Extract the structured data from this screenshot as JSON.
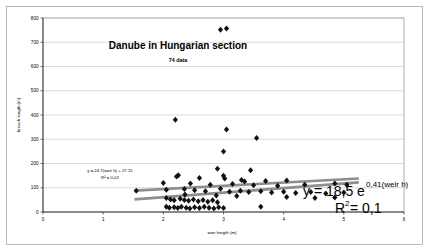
{
  "chart_data": {
    "type": "scatter",
    "title": "Danube in Hungarian section",
    "subtitle": "74 data",
    "xlabel": "weir heigth (m)",
    "ylabel": "breach length (m)",
    "xlim": [
      0,
      6
    ],
    "ylim": [
      0,
      800
    ],
    "xticks": [
      "0",
      "1",
      "2",
      "3",
      "4",
      "5",
      "6"
    ],
    "yticks": [
      "0",
      "100",
      "200",
      "300",
      "400",
      "500",
      "600",
      "700",
      "800"
    ],
    "grid": true,
    "legend": "none",
    "marker_symbol": "diamond",
    "marker_color": "#111111",
    "trendline_color": "#8e8e8e",
    "annotations": [
      {
        "name": "linear-fit-label",
        "line1": "y = 24.7(weir h) + 27.15",
        "line2": "R² = 0,02"
      },
      {
        "name": "exponential-fit-label",
        "prefix": "y = 18,5 e",
        "exponent": "0,41(weir h)",
        "r2_symbol": "R",
        "r2_sup": "2",
        "r2_value": " = 0,1"
      }
    ],
    "series": [
      {
        "name": "breach length vs weir heigth",
        "points": [
          [
            2.95,
            752
          ],
          [
            3.05,
            757
          ],
          [
            2.2,
            380
          ],
          [
            3.05,
            340
          ],
          [
            3.55,
            305
          ],
          [
            3.0,
            250
          ],
          [
            2.9,
            178
          ],
          [
            3.45,
            172
          ],
          [
            2.25,
            152
          ],
          [
            2.22,
            146
          ],
          [
            3.0,
            150
          ],
          [
            3.02,
            138
          ],
          [
            2.6,
            140
          ],
          [
            3.3,
            132
          ],
          [
            3.35,
            126
          ],
          [
            3.7,
            128
          ],
          [
            4.05,
            130
          ],
          [
            2.0,
            120
          ],
          [
            2.45,
            118
          ],
          [
            2.78,
            112
          ],
          [
            3.15,
            115
          ],
          [
            3.5,
            110
          ],
          [
            3.9,
            108
          ],
          [
            4.35,
            112
          ],
          [
            4.85,
            118
          ],
          [
            5.05,
            112
          ],
          [
            1.55,
            88
          ],
          [
            2.05,
            92
          ],
          [
            2.35,
            95
          ],
          [
            2.52,
            90
          ],
          [
            2.7,
            86
          ],
          [
            2.95,
            96
          ],
          [
            3.1,
            84
          ],
          [
            3.28,
            88
          ],
          [
            3.42,
            82
          ],
          [
            3.62,
            86
          ],
          [
            3.8,
            80
          ],
          [
            4.0,
            84
          ],
          [
            4.2,
            78
          ],
          [
            4.45,
            82
          ],
          [
            4.7,
            76
          ],
          [
            5.0,
            80
          ],
          [
            2.05,
            58
          ],
          [
            2.12,
            52
          ],
          [
            2.18,
            48
          ],
          [
            2.28,
            55
          ],
          [
            2.35,
            50
          ],
          [
            2.42,
            46
          ],
          [
            2.5,
            52
          ],
          [
            2.58,
            44
          ],
          [
            2.66,
            50
          ],
          [
            2.74,
            42
          ],
          [
            2.82,
            48
          ],
          [
            2.9,
            40
          ],
          [
            2.05,
            22
          ],
          [
            2.1,
            18
          ],
          [
            2.18,
            20
          ],
          [
            2.24,
            16
          ],
          [
            2.3,
            22
          ],
          [
            2.38,
            18
          ],
          [
            2.44,
            14
          ],
          [
            2.52,
            20
          ],
          [
            2.6,
            16
          ],
          [
            2.68,
            22
          ],
          [
            2.76,
            18
          ],
          [
            2.84,
            14
          ],
          [
            2.92,
            20
          ],
          [
            3.0,
            16
          ],
          [
            3.62,
            22
          ],
          [
            4.05,
            62
          ],
          [
            4.52,
            58
          ],
          [
            4.85,
            60
          ],
          [
            2.36,
            72
          ],
          [
            2.88,
            68
          ],
          [
            3.22,
            66
          ]
        ]
      }
    ],
    "trendlines": [
      {
        "name": "upper-trendline",
        "x1": 1.52,
        "y1": 88,
        "x2": 5.25,
        "y2": 138
      },
      {
        "name": "lower-trendline",
        "x1": 1.52,
        "y1": 52,
        "x2": 5.25,
        "y2": 122
      }
    ]
  }
}
